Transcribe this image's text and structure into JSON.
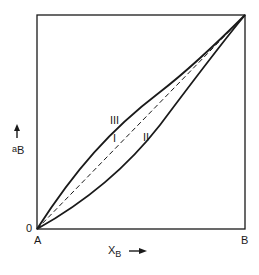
{
  "diagram": {
    "type": "activity-composition",
    "x_axis": {
      "label_main": "X",
      "label_sub": "B",
      "arrow": "right-arrow",
      "left_end": "A",
      "right_end": "B"
    },
    "y_axis": {
      "label_main": "a",
      "label_sub": "B",
      "arrow": "up-arrow",
      "origin": "0"
    },
    "curves": [
      {
        "id": "I",
        "label": "I",
        "style": "dashed",
        "description": "ideal (Raoultian) straight line"
      },
      {
        "id": "II",
        "label": "II",
        "style": "solid",
        "description": "positive deviation (above diagonal)"
      },
      {
        "id": "III",
        "label": "III",
        "style": "solid",
        "description": "negative deviation (below diagonal)"
      }
    ],
    "colors": {
      "line": "#1a1a1a",
      "background": "#ffffff"
    }
  }
}
